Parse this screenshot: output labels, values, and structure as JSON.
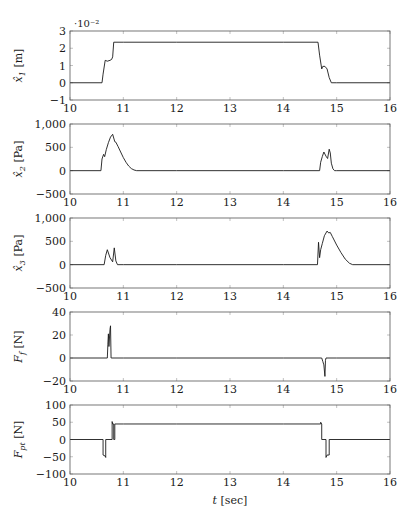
{
  "chart_data": [
    {
      "type": "line",
      "ylabel": "x̂1 [m]",
      "ylabel_parts": {
        "var": "x̂",
        "sub": "1",
        "unit": " [m]"
      },
      "xlabel": "",
      "scale_note": "·10⁻²",
      "xlim": [
        10,
        16
      ],
      "ylim": [
        -0.01,
        0.03
      ],
      "xticks": [
        10,
        11,
        12,
        13,
        14,
        15,
        16
      ],
      "yticks": [
        -0.01,
        0,
        0.01,
        0.02,
        0.03
      ],
      "ytick_labels": [
        "−1",
        "0",
        "1",
        "2",
        "3"
      ],
      "grid": false,
      "series": [
        {
          "name": "x̂1",
          "x": [
            10,
            10.6,
            10.62,
            10.66,
            10.7,
            10.75,
            10.78,
            10.8,
            10.82,
            11,
            12,
            13,
            14,
            14.65,
            14.68,
            14.72,
            14.74,
            14.78,
            14.82,
            14.86,
            14.9,
            15,
            16
          ],
          "y": [
            0,
            0,
            0.005,
            0.013,
            0.0125,
            0.013,
            0.0135,
            0.015,
            0.0235,
            0.0235,
            0.0235,
            0.0235,
            0.0235,
            0.0235,
            0.016,
            0.008,
            0.0095,
            0.0095,
            0.008,
            0.003,
            0,
            0,
            0
          ]
        }
      ]
    },
    {
      "type": "line",
      "ylabel": "x̂2 [Pa]",
      "ylabel_parts": {
        "var": "x̂",
        "sub": "2",
        "unit": " [Pa]"
      },
      "xlabel": "",
      "xlim": [
        10,
        16
      ],
      "ylim": [
        -500,
        1000
      ],
      "xticks": [
        10,
        11,
        12,
        13,
        14,
        15,
        16
      ],
      "yticks": [
        -500,
        0,
        500,
        1000
      ],
      "ytick_labels": [
        "−500",
        "0",
        "500",
        "1,000"
      ],
      "grid": false,
      "series": [
        {
          "name": "x̂2",
          "x": [
            10,
            10.58,
            10.6,
            10.63,
            10.65,
            10.68,
            10.72,
            10.76,
            10.8,
            10.82,
            10.84,
            10.86,
            10.9,
            10.95,
            11.0,
            11.05,
            11.1,
            11.15,
            11.2,
            11.25,
            12,
            13,
            14,
            14.68,
            14.7,
            14.73,
            14.76,
            14.8,
            14.83,
            14.86,
            14.88,
            14.9,
            14.93,
            14.96,
            15,
            16
          ],
          "y": [
            0,
            0,
            250,
            350,
            300,
            450,
            600,
            720,
            780,
            700,
            620,
            610,
            520,
            400,
            280,
            180,
            100,
            45,
            15,
            0,
            0,
            0,
            0,
            0,
            180,
            300,
            400,
            310,
            260,
            460,
            380,
            160,
            40,
            0,
            0,
            0
          ]
        }
      ]
    },
    {
      "type": "line",
      "ylabel": "x̂3 [Pa]",
      "ylabel_parts": {
        "var": "x̂",
        "sub": "3",
        "unit": " [Pa]"
      },
      "xlabel": "",
      "xlim": [
        10,
        16
      ],
      "ylim": [
        -500,
        1000
      ],
      "xticks": [
        10,
        11,
        12,
        13,
        14,
        15,
        16
      ],
      "yticks": [
        -500,
        0,
        500,
        1000
      ],
      "ytick_labels": [
        "−500",
        "0",
        "500",
        "1,000"
      ],
      "grid": false,
      "series": [
        {
          "name": "x̂3",
          "x": [
            10,
            10.64,
            10.67,
            10.7,
            10.75,
            10.8,
            10.83,
            10.86,
            10.89,
            11,
            12,
            13,
            14,
            14.64,
            14.66,
            14.68,
            14.7,
            14.73,
            14.77,
            14.82,
            14.85,
            14.88,
            14.92,
            15.0,
            15.08,
            15.16,
            15.24,
            15.3,
            16
          ],
          "y": [
            0,
            0,
            200,
            320,
            150,
            60,
            360,
            80,
            0,
            0,
            0,
            0,
            0,
            0,
            480,
            150,
            320,
            450,
            620,
            720,
            680,
            690,
            600,
            420,
            260,
            120,
            30,
            0,
            0
          ]
        }
      ]
    },
    {
      "type": "line",
      "ylabel": "Ff [N]",
      "ylabel_parts": {
        "var": "F",
        "sub": "f",
        "unit": " [N]"
      },
      "xlabel": "",
      "xlim": [
        10,
        16
      ],
      "ylim": [
        -20,
        40
      ],
      "xticks": [
        10,
        11,
        12,
        13,
        14,
        15,
        16
      ],
      "yticks": [
        -20,
        0,
        20,
        40
      ],
      "ytick_labels": [
        "−20",
        "0",
        "20",
        "40"
      ],
      "grid": false,
      "series": [
        {
          "name": "Ff",
          "x": [
            10,
            10.7,
            10.71,
            10.72,
            10.73,
            10.75,
            10.76,
            10.77,
            10.78,
            11,
            12,
            13,
            14,
            14.72,
            14.74,
            14.76,
            14.78,
            14.79,
            14.8,
            15,
            16
          ],
          "y": [
            0,
            0,
            12,
            21,
            10,
            25,
            28,
            0,
            0,
            0,
            0,
            0,
            0,
            0,
            -3,
            -6,
            -16,
            -2,
            0,
            0,
            0
          ]
        }
      ]
    },
    {
      "type": "line",
      "ylabel": "Fpt [N]",
      "ylabel_parts": {
        "var": "F",
        "sub": "pt",
        "unit": " [N]"
      },
      "xlabel": "t [sec]",
      "xlabel_parts": {
        "var": "t",
        "unit": " [sec]"
      },
      "xlim": [
        10,
        16
      ],
      "ylim": [
        -100,
        100
      ],
      "xticks": [
        10,
        11,
        12,
        13,
        14,
        15,
        16
      ],
      "yticks": [
        -100,
        -50,
        0,
        50,
        100
      ],
      "ytick_labels": [
        "−100",
        "−50",
        "0",
        "50",
        "100"
      ],
      "grid": false,
      "series": [
        {
          "name": "Fpt",
          "x": [
            10,
            10.62,
            10.62,
            10.66,
            10.67,
            10.67,
            10.79,
            10.79,
            10.8,
            10.82,
            10.82,
            10.84,
            10.84,
            11,
            12,
            13,
            14,
            14.7,
            14.7,
            14.72,
            14.72,
            14.8,
            14.8,
            14.82,
            14.86,
            14.86,
            16
          ],
          "y": [
            0,
            0,
            -45,
            -48,
            -52,
            0,
            0,
            52,
            45,
            45,
            0,
            0,
            45,
            45,
            45,
            45,
            45,
            45,
            50,
            45,
            0,
            0,
            -52,
            -45,
            -45,
            0,
            0
          ]
        }
      ]
    }
  ],
  "figure": {
    "xtick_labels": [
      "10",
      "11",
      "12",
      "13",
      "14",
      "15",
      "16"
    ],
    "line_color": "#1a1a1a",
    "frame_color": "#555555",
    "tick_color": "#999999"
  }
}
